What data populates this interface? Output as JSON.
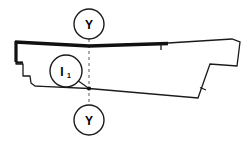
{
  "drawing": {
    "title": "Sectioned profile outline with section markers",
    "background_color": "#ffffff",
    "line_color": "#1a1a1a",
    "centerline_color": "#9a9a9a",
    "section_markers": [
      {
        "name": "section-marker-top",
        "label": "Y",
        "cx": 89,
        "cy": 24,
        "r": 15
      },
      {
        "name": "section-marker-bottom",
        "label": "Y",
        "cx": 89,
        "cy": 120,
        "r": 15
      }
    ],
    "detail_callout": {
      "name": "detail-callout-i1",
      "label": "I",
      "subscript": "1",
      "cx": 66,
      "cy": 71,
      "r": 16
    },
    "centerline": {
      "name": "section-centerline-y-y",
      "x": 89,
      "y_top": 39,
      "y_bottom": 105,
      "dash": "3 3"
    },
    "intersection_point": {
      "name": "section-intersection-point",
      "x": 89,
      "y": 88.5
    },
    "tick_marks": [
      {
        "name": "tick-mark-top-edge",
        "x1": 161,
        "y1": 45,
        "x2": 161,
        "y2": 50
      },
      {
        "name": "tick-mark-right-diagonal",
        "x1": 200,
        "y1": 86,
        "x2": 205,
        "y2": 89
      }
    ],
    "outline_thick_top": "M 15,41 L 89,45 L 168,43",
    "outline_thin_top_right": "M 168,43 L 232,39 L 240,42 L 237,66 L 210,64 L 198,98 L 89,88.5",
    "outline_left_profile": "M 15,41 L 15,64 L 22,64 L 22,76 L 29,76 L 29,82 L 32,85 L 40,86 L 89,88.5",
    "outline_inner_top": "M 18,44 L 89,47.5 L 168,45.5",
    "leader_line": "M 77,80 L 89,88.5"
  }
}
